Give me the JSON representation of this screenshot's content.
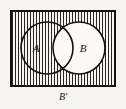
{
  "diagram": {
    "type": "venn-diagram",
    "background_color": "#f7f5ef",
    "ink_color": "#16130f",
    "universe": {
      "name": "universal-set-rectangle",
      "x": 11,
      "y": 11,
      "width": 104,
      "height": 75,
      "stroke_width": 2,
      "fill": "none"
    },
    "shading": {
      "pattern": "vertical-lines",
      "spacing_px": 3,
      "line_width_px": 1,
      "color": "#2a2620",
      "description": "Universal rectangle shaded everywhere except inside circle B",
      "shaded_region_label": "B'"
    },
    "circles": [
      {
        "id": "A",
        "label": "A",
        "cx": 47,
        "cy": 48,
        "r": 26,
        "label_x": 36,
        "label_y": 52,
        "shaded": true
      },
      {
        "id": "B",
        "label": "B",
        "cx": 79,
        "cy": 48,
        "r": 26,
        "label_x": 83,
        "label_y": 52,
        "shaded": false
      }
    ],
    "annotations": [
      {
        "id": "complement-label",
        "text": "B'",
        "x": 63,
        "y": 100,
        "position": "below-rectangle",
        "meaning": "complement of set B"
      }
    ]
  }
}
